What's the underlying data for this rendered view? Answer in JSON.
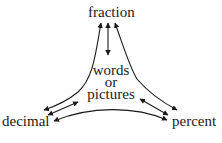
{
  "diagram": {
    "nodes": {
      "top": "fraction",
      "left": "decimal",
      "right": "percent",
      "center": [
        "words",
        "or",
        "pictures"
      ]
    },
    "edges": [
      {
        "from": "fraction",
        "to": "decimal",
        "type": "bidirectional"
      },
      {
        "from": "fraction",
        "to": "percent",
        "type": "bidirectional"
      },
      {
        "from": "fraction",
        "to": "words or pictures",
        "type": "bidirectional"
      },
      {
        "from": "words or pictures",
        "to": "decimal",
        "type": "bidirectional"
      },
      {
        "from": "words or pictures",
        "to": "percent",
        "type": "bidirectional"
      },
      {
        "from": "decimal",
        "to": "percent",
        "type": "bidirectional"
      }
    ],
    "colors": {
      "line": "#1a1a1a",
      "background": "#ffffff"
    }
  }
}
